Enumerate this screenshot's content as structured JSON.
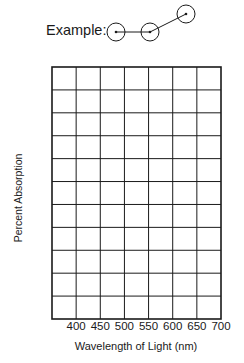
{
  "example": {
    "label": "Example:",
    "points": [
      {
        "cx": 116,
        "cy": 32
      },
      {
        "cx": 150,
        "cy": 32
      },
      {
        "cx": 186,
        "cy": 14
      }
    ],
    "radius": 9
  },
  "chart_data": {
    "type": "line",
    "title": "",
    "xlabel": "Wavelength of Light (nm)",
    "ylabel": "Percent Absorption",
    "x_ticks": [
      "400",
      "450",
      "500",
      "550",
      "600",
      "650",
      "700"
    ],
    "xlim": [
      350,
      700
    ],
    "y_ticks": [],
    "grid": true,
    "grid_columns": 7,
    "grid_rows": 11,
    "series": [],
    "note": "Blank graph grid for student plotting; no data points plotted"
  },
  "colors": {
    "line": "#1a1a1a",
    "background": "#ffffff"
  }
}
